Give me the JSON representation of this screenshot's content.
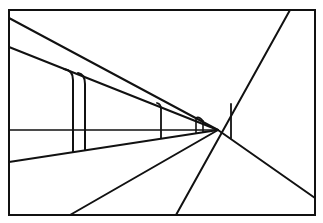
{
  "diagram": {
    "type": "one-point perspective line drawing",
    "stroke_color": "#111111",
    "background": "#ffffff",
    "frame": {
      "x": 9,
      "y": 10,
      "width": 306,
      "height": 205
    },
    "vanishing_point": {
      "x": 218,
      "y": 130
    },
    "horizon_y": 130,
    "converging_lines": [
      {
        "from": [
          9,
          18
        ],
        "to": [
          218,
          130
        ]
      },
      {
        "from": [
          9,
          47
        ],
        "to": [
          218,
          130
        ]
      },
      {
        "from": [
          9,
          162
        ],
        "to": [
          218,
          130
        ]
      },
      {
        "from": [
          70,
          215
        ],
        "to": [
          218,
          130
        ]
      },
      {
        "from": [
          176,
          215
        ],
        "to": [
          290,
          10
        ]
      },
      {
        "from": [
          218,
          130
        ],
        "to": [
          315,
          198
        ]
      }
    ],
    "horizon_line": {
      "from": [
        9,
        130
      ],
      "to": [
        218,
        130
      ]
    },
    "posts": [
      {
        "x": 73,
        "top": 72,
        "bottom": 152
      },
      {
        "x": 85,
        "top": 76,
        "bottom": 150
      },
      {
        "x": 161,
        "top": 104,
        "bottom": 138
      },
      {
        "x": 196,
        "top": 118,
        "bottom": 133
      },
      {
        "x": 203,
        "top": 121,
        "bottom": 132
      },
      {
        "x": 231,
        "top": 104,
        "bottom": 138
      }
    ]
  }
}
